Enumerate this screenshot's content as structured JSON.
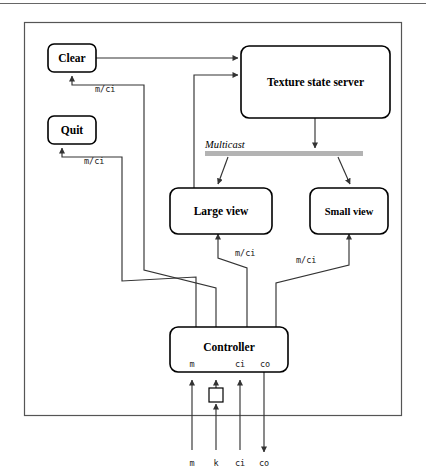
{
  "figure": {
    "type": "block-diagram",
    "background": "#ffffff",
    "frame": {
      "stroke": "#555555"
    },
    "top_rule": {
      "present": true,
      "stroke": "#666666"
    }
  },
  "nodes": {
    "clear": {
      "label": "Clear"
    },
    "quit": {
      "label": "Quit"
    },
    "texture_state_server": {
      "label": "Texture state server"
    },
    "large_view": {
      "label": "Large view"
    },
    "small_view": {
      "label": "Small view"
    },
    "controller": {
      "label": "Controller"
    },
    "mouse": {
      "label": ""
    }
  },
  "bus": {
    "label": "Multicast",
    "color": "#b3b3b3"
  },
  "controller_ports": {
    "m": "m",
    "ci": "ci",
    "co": "co"
  },
  "external_ports": {
    "m": "m",
    "k": "k",
    "ci": "ci",
    "co": "co"
  },
  "edge_labels": {
    "clear_to_controller": "m/ci",
    "quit_to_controller": "m/ci",
    "large_view_to_controller": "m/ci",
    "small_view_to_controller": "m/ci"
  }
}
